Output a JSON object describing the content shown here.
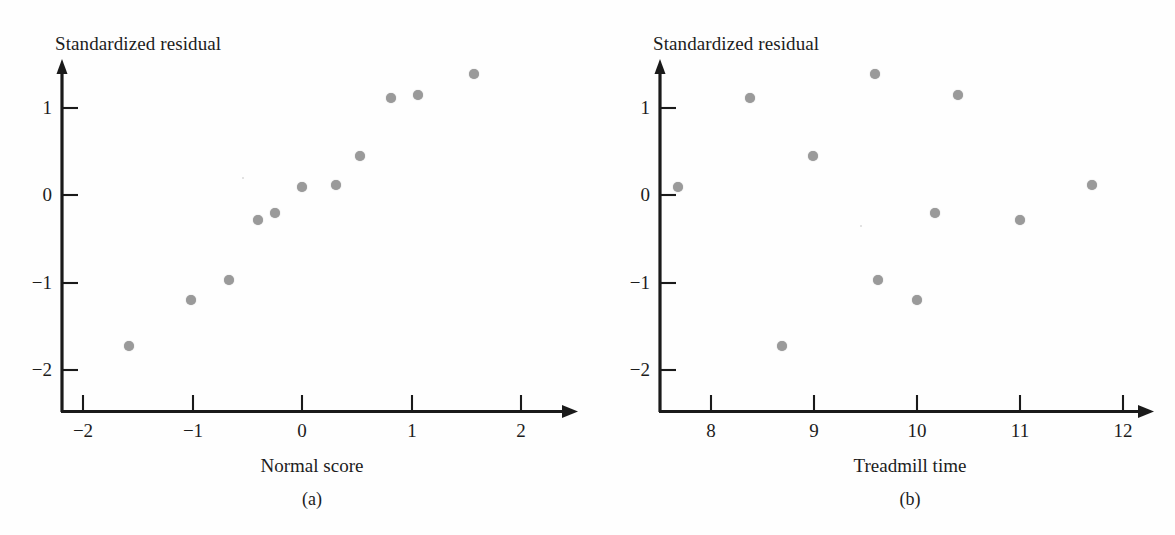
{
  "figure": {
    "width": 1175,
    "height": 535,
    "background": "#fefefe",
    "point_color": "#9a9a9a",
    "axis_color": "#1a1a1a"
  },
  "chart_data": [
    {
      "id": "a",
      "type": "scatter",
      "title": "",
      "caption": "(a)",
      "xlabel": "Normal score",
      "ylabel": "Standardized residual",
      "xlim": [
        -2.45,
        2.3
      ],
      "ylim": [
        -2.5,
        1.75
      ],
      "xticks": [
        -2,
        -1,
        0,
        1,
        2
      ],
      "xtick_labels": [
        "−2",
        "−1",
        "0",
        "1",
        "2"
      ],
      "yticks": [
        -2,
        -1,
        0,
        1
      ],
      "ytick_labels": [
        "−2",
        "−1",
        "0",
        "1"
      ],
      "grid": false,
      "legend": "none",
      "x": [
        -1.58,
        -1.01,
        -0.67,
        -0.4,
        -0.25,
        0.0,
        0.31,
        0.53,
        0.81,
        1.06,
        1.57
      ],
      "y": [
        -1.73,
        -1.2,
        -0.97,
        -0.28,
        -0.21,
        0.09,
        0.11,
        0.45,
        1.11,
        1.14,
        1.38
      ],
      "points": [
        {
          "x": -1.58,
          "y": -1.73
        },
        {
          "x": -1.01,
          "y": -1.2
        },
        {
          "x": -0.67,
          "y": -0.97
        },
        {
          "x": -0.4,
          "y": -0.28
        },
        {
          "x": -0.25,
          "y": -0.21
        },
        {
          "x": 0.0,
          "y": 0.09
        },
        {
          "x": 0.31,
          "y": 0.11
        },
        {
          "x": 0.53,
          "y": 0.45
        },
        {
          "x": 0.81,
          "y": 1.11
        },
        {
          "x": 1.06,
          "y": 1.14
        },
        {
          "x": 1.57,
          "y": 1.38
        }
      ]
    },
    {
      "id": "b",
      "type": "scatter",
      "title": "",
      "caption": "(b)",
      "xlabel": "Treadmill time",
      "ylabel": "Standardized residual",
      "xlim": [
        7.48,
        12.35
      ],
      "ylim": [
        -2.5,
        1.75
      ],
      "xticks": [
        8,
        9,
        10,
        11,
        12
      ],
      "xtick_labels": [
        "8",
        "9",
        "10",
        "11",
        "12"
      ],
      "yticks": [
        -2,
        -1,
        0,
        1
      ],
      "ytick_labels": [
        "−2",
        "−1",
        "0",
        "1"
      ],
      "grid": false,
      "legend": "none",
      "x": [
        7.68,
        8.38,
        8.69,
        8.99,
        9.59,
        9.62,
        10.0,
        10.17,
        10.4,
        11.0,
        11.7
      ],
      "y": [
        0.09,
        1.11,
        -1.73,
        0.45,
        1.38,
        -0.97,
        -1.2,
        -0.21,
        1.14,
        -0.28,
        0.11
      ],
      "points": [
        {
          "x": 7.68,
          "y": 0.09
        },
        {
          "x": 8.38,
          "y": 1.11
        },
        {
          "x": 8.69,
          "y": -1.73
        },
        {
          "x": 8.99,
          "y": 0.45
        },
        {
          "x": 9.59,
          "y": 1.38
        },
        {
          "x": 9.62,
          "y": -0.97
        },
        {
          "x": 10.0,
          "y": -1.2
        },
        {
          "x": 10.17,
          "y": -0.21
        },
        {
          "x": 10.4,
          "y": 1.14
        },
        {
          "x": 11.0,
          "y": -0.28
        },
        {
          "x": 11.7,
          "y": 0.11
        }
      ]
    }
  ]
}
